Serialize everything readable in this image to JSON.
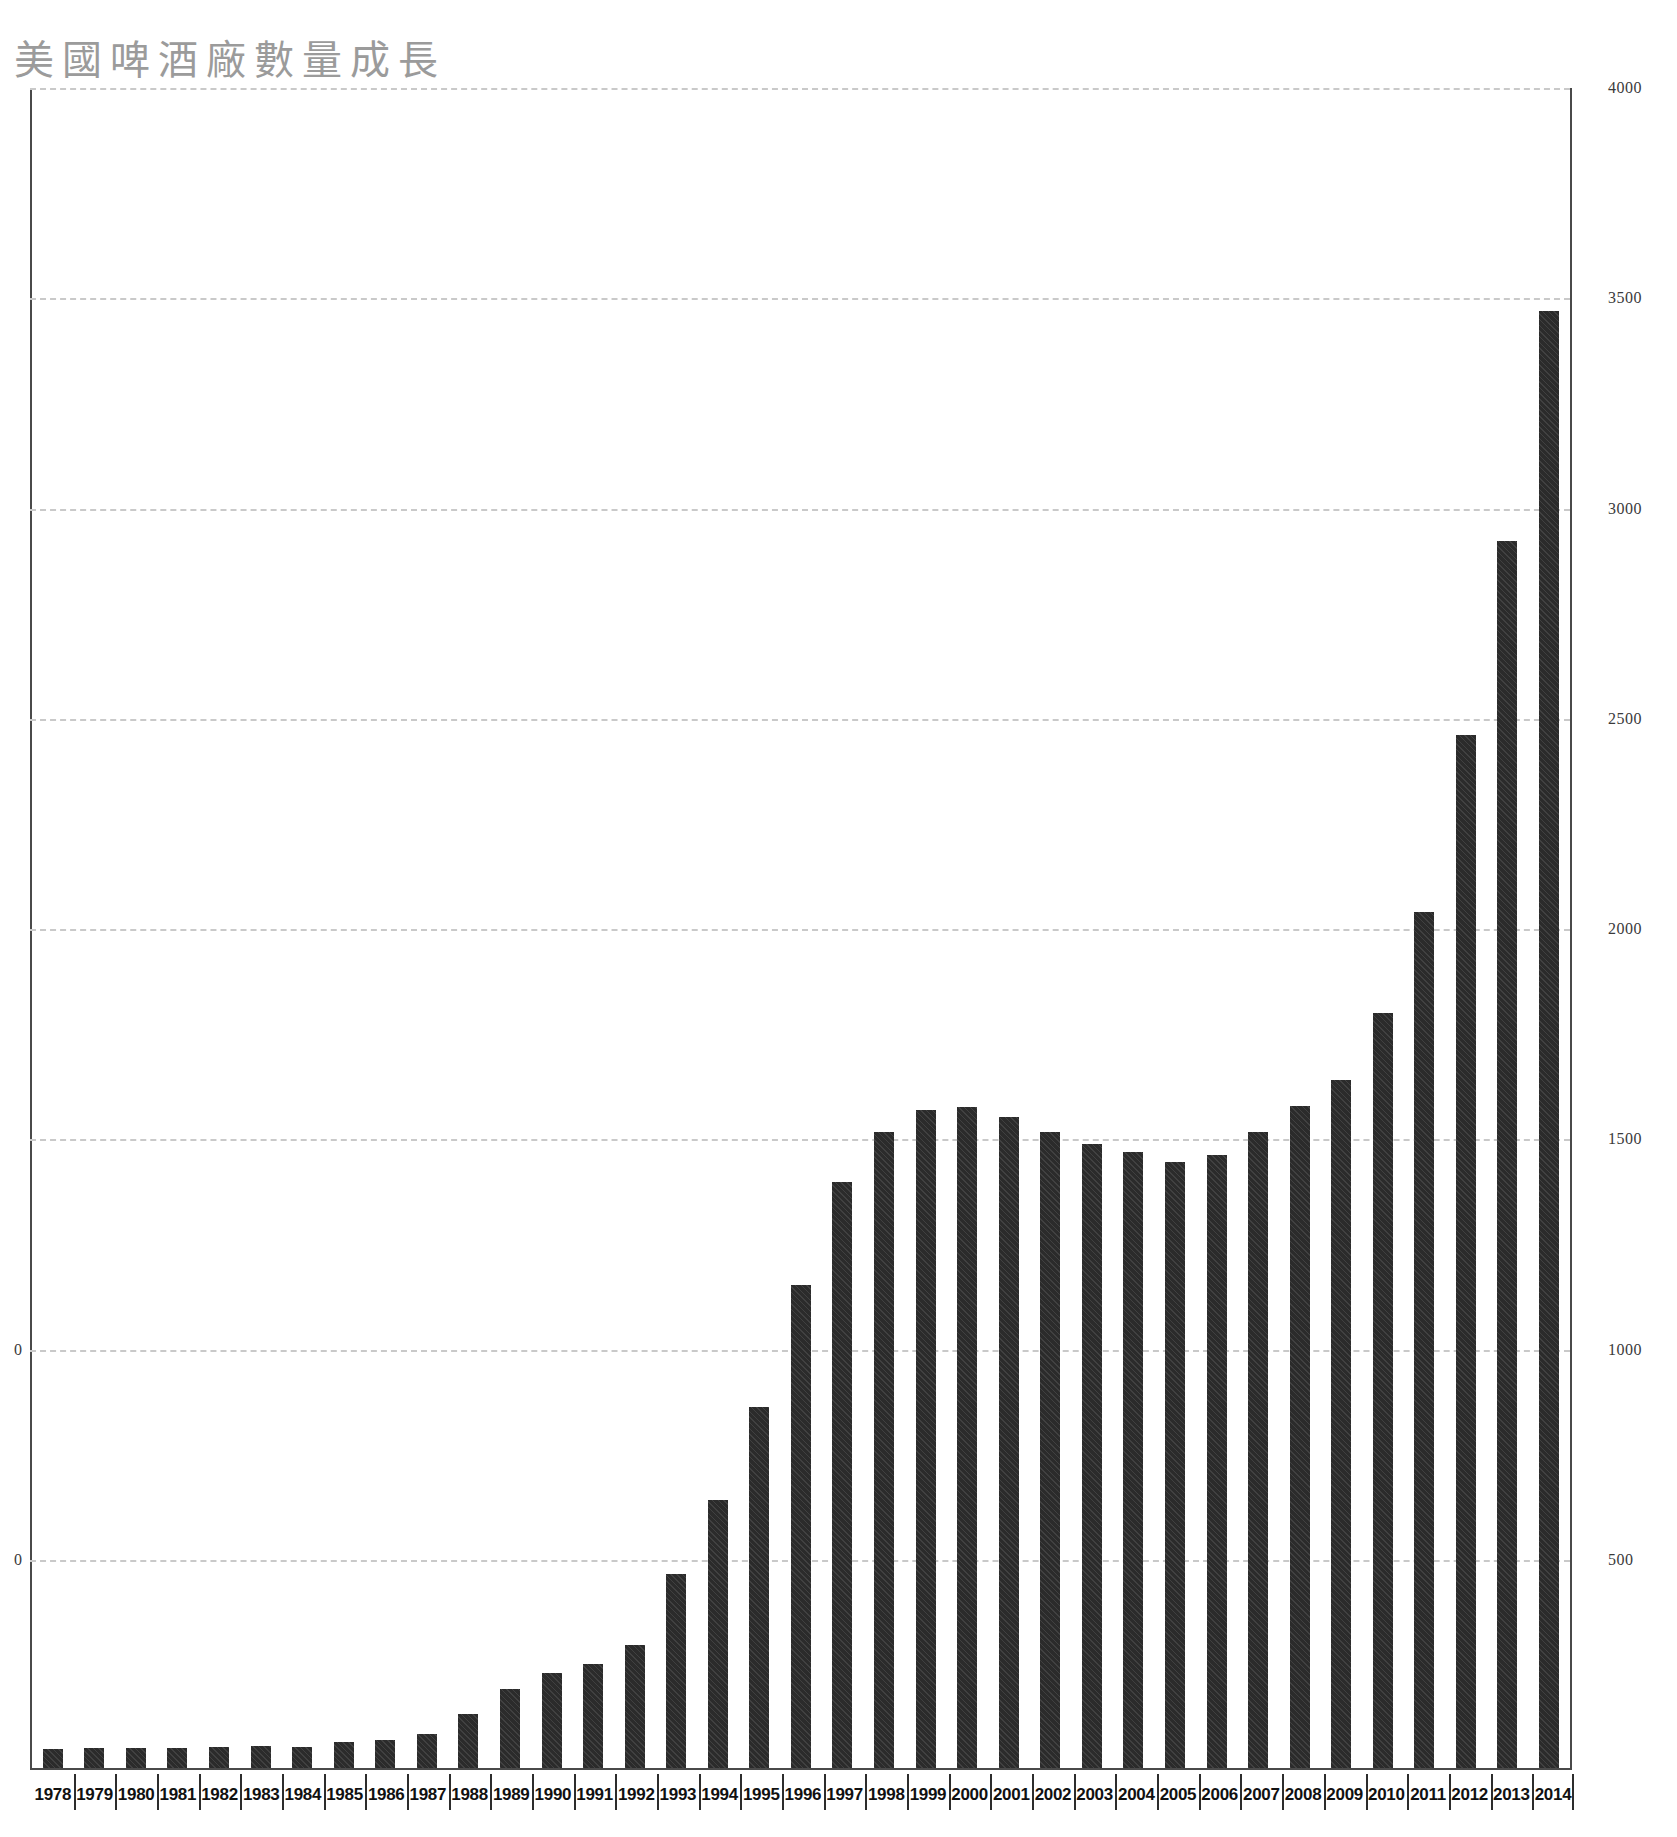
{
  "title": "美國啤酒廠數量成長",
  "chart_data": {
    "type": "bar",
    "title": "美國啤酒廠數量成長",
    "xlabel": "",
    "ylabel": "",
    "ylim": [
      0,
      4000
    ],
    "grid": true,
    "legend": "none",
    "y_ticks": [
      4000,
      3500,
      3000,
      2500,
      2000,
      1500,
      1000,
      500
    ],
    "y_tick_labels_right": [
      "4000",
      "3500",
      "3000",
      "2500",
      "2000",
      "1500",
      "1000",
      "500"
    ],
    "y_tick_labels_left": [
      "0",
      "0"
    ],
    "categories": [
      "1978",
      "1979",
      "1980",
      "1981",
      "1982",
      "1983",
      "1984",
      "1985",
      "1986",
      "1987",
      "1988",
      "1989",
      "1990",
      "1991",
      "1992",
      "1993",
      "1994",
      "1995",
      "1996",
      "1997",
      "1998",
      "1999",
      "2000",
      "2001",
      "2002",
      "2003",
      "2004",
      "2005",
      "2006",
      "2007",
      "2008",
      "2009",
      "2010",
      "2011",
      "2012",
      "2013",
      "2014"
    ],
    "values": [
      45,
      47,
      48,
      47,
      51,
      52,
      50,
      61,
      67,
      80,
      128,
      188,
      226,
      248,
      292,
      462,
      637,
      858,
      1149,
      1393,
      1512,
      1565,
      1571,
      1548,
      1513,
      1484,
      1466,
      1442,
      1457,
      1512,
      1574,
      1635,
      1796,
      2036,
      2456,
      2917,
      3464
    ],
    "bar_color": "#2b2b2b",
    "grid_color": "#c9c9c9",
    "axis_color": "#4a4a4a",
    "title_color": "#9b9b9b"
  }
}
